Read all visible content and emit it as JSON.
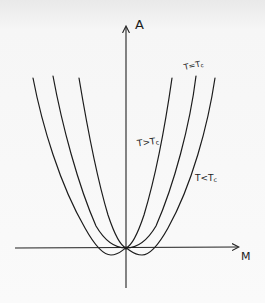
{
  "diagram": {
    "title": "",
    "axes": {
      "y_label": "A",
      "x_label": "M"
    },
    "curves": [
      {
        "id": "t-greater-tc",
        "label_main": "T>T",
        "label_sub": "c",
        "shape": "single-well, narrowest"
      },
      {
        "id": "t-equal-tc",
        "label_main": "T=T",
        "label_sub": "c",
        "shape": "single-well, flat-bottomed (quartic)"
      },
      {
        "id": "t-less-tc",
        "label_main": "T<T",
        "label_sub": "c",
        "shape": "double-well, widest, two minima below M axis"
      }
    ],
    "colors": {
      "ink": "#1c1c1c",
      "paper": "#f6f6f6"
    }
  }
}
